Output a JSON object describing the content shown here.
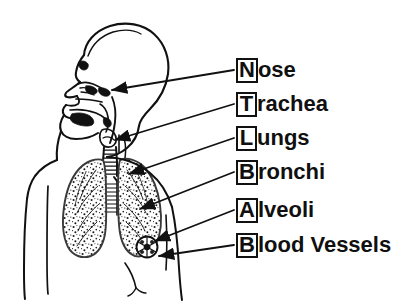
{
  "figure": {
    "background_color": "#ffffff",
    "ink_color": "#111111",
    "width": 414,
    "height": 306
  },
  "labels": [
    {
      "key": "N",
      "rest": "ose",
      "full": "Nose",
      "box_x": 236,
      "box_y": 57,
      "leader_from_x": 236,
      "leader_from_y": 70,
      "target_x": 110,
      "target_y": 89
    },
    {
      "key": "T",
      "rest": "rachea",
      "full": "Trachea",
      "box_x": 236,
      "box_y": 91,
      "leader_from_x": 236,
      "leader_from_y": 104,
      "target_x": 113,
      "target_y": 139
    },
    {
      "key": "L",
      "rest": "ungs",
      "full": "Lungs",
      "box_x": 236,
      "box_y": 125,
      "leader_from_x": 236,
      "leader_from_y": 138,
      "target_x": 127,
      "target_y": 173
    },
    {
      "key": "B",
      "rest": "ronchi",
      "full": "Bronchi",
      "box_x": 236,
      "box_y": 159,
      "leader_from_x": 236,
      "leader_from_y": 172,
      "target_x": 138,
      "target_y": 208
    },
    {
      "key": "A",
      "rest": "lveoli",
      "full": "Alveoli",
      "box_x": 236,
      "box_y": 197,
      "leader_from_x": 236,
      "leader_from_y": 210,
      "target_x": 153,
      "target_y": 240
    },
    {
      "key": "B",
      "rest": "lood Vessels",
      "full": "Blood Vessels",
      "box_x": 236,
      "box_y": 232,
      "leader_from_x": 236,
      "leader_from_y": 245,
      "target_x": 157,
      "target_y": 256
    }
  ],
  "anatomy": {
    "parts": [
      "head-profile",
      "nasal-cavity",
      "oral-cavity",
      "pharynx",
      "larynx",
      "trachea",
      "left-lung",
      "right-lung",
      "bronchi",
      "alveoli-cluster",
      "torso-outline"
    ]
  }
}
